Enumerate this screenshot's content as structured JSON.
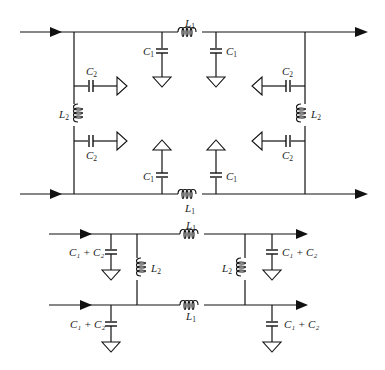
{
  "diagram": {
    "top_circuit": {
      "description": "Two-conductor lumped line: series L1 on each rail, shunt C1 to ground on each side of L1, cross-rung L2 with C2 to ground at both ends, on left and right.",
      "labels": {
        "L1_top": "L",
        "L1_top_sub": "1",
        "L1_bottom": "L",
        "L1_bottom_sub": "1",
        "C1_tl": "C",
        "C1_tl_sub": "1",
        "C1_tr": "C",
        "C1_tr_sub": "1",
        "C1_bl": "C",
        "C1_bl_sub": "1",
        "C1_br": "C",
        "C1_br_sub": "1",
        "C2_lt": "C",
        "C2_lt_sub": "2",
        "C2_lb": "C",
        "C2_lb_sub": "2",
        "C2_rt": "C",
        "C2_rt_sub": "2",
        "C2_rb": "C",
        "C2_rb_sub": "2",
        "L2_left": "L",
        "L2_left_sub": "2",
        "L2_right": "L",
        "L2_right_sub": "2"
      }
    },
    "bottom_circuit": {
      "description": "Simplified equivalent: series L1 on each rail, L2 cross-rungs, shunt C1 + C2 to ground at each port.",
      "labels": {
        "L1_top": "L",
        "L1_top_sub": "1",
        "L1_bottom": "L",
        "L1_bottom_sub": "1",
        "L2_left": "L",
        "L2_left_sub": "2",
        "L2_right": "L",
        "L2_right_sub": "2",
        "C12_tl": "C₁ + C₂",
        "C12_bl": "C₁ + C₂",
        "C12_tr": "C₁ + C₂",
        "C12_br": "C₁ + C₂"
      }
    }
  }
}
